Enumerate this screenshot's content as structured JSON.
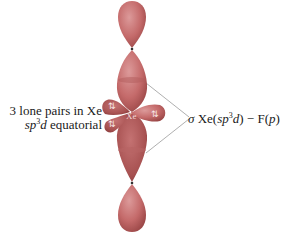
{
  "diagram": {
    "type": "orbital-diagram",
    "central_atom_label": "Xe",
    "lone_pair_marker": "⇅",
    "left_label": {
      "line1": "3 lone pairs in Xe",
      "line2_prefix": "sp",
      "line2_sup": "3",
      "line2_d": "d",
      "line2_suffix": " equatorial"
    },
    "right_label": {
      "sigma": "σ",
      "xe": " Xe(",
      "sp": "sp",
      "sup": "3",
      "d": "d",
      "close": ") − F(",
      "p": "p",
      "end": ")"
    },
    "colors": {
      "lobe_fill": "#c46a6a",
      "lobe_dark": "#a24c4c",
      "lobe_light": "#d98e8e",
      "leader_line": "#9a9a9a",
      "text": "#1a1a1a"
    }
  }
}
